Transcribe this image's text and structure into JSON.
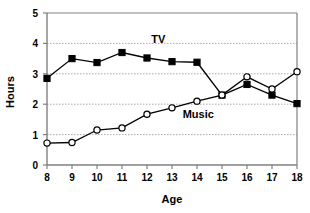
{
  "chart_data": {
    "type": "line",
    "title": "",
    "xlabel": "Age",
    "ylabel": "Hours",
    "categories": [
      8,
      9,
      10,
      11,
      12,
      13,
      14,
      15,
      16,
      17,
      18
    ],
    "x_tick_labels": [
      "8",
      "9",
      "10",
      "11",
      "12",
      "13",
      "14",
      "15",
      "16",
      "17",
      "18"
    ],
    "y_tick_labels": [
      "0",
      "1",
      "2",
      "3",
      "4",
      "5"
    ],
    "y_ticks": [
      0,
      1,
      2,
      3,
      4,
      5
    ],
    "ylim": [
      0,
      5
    ],
    "xlim": [
      8,
      18
    ],
    "grid": "horizontal-dotted",
    "legend_position": "inline-annotations",
    "series": [
      {
        "name": "TV",
        "marker": "filled-square",
        "color": "#000000",
        "values": [
          2.85,
          3.5,
          3.37,
          3.7,
          3.52,
          3.4,
          3.38,
          2.3,
          2.65,
          2.3,
          2.02
        ]
      },
      {
        "name": "Music",
        "marker": "open-circle",
        "color": "#000000",
        "values": [
          0.72,
          0.74,
          1.15,
          1.22,
          1.67,
          1.88,
          2.1,
          2.3,
          2.9,
          2.5,
          3.07
        ]
      }
    ],
    "annotations": [
      {
        "text": "TV",
        "x": 12.45,
        "y": 4.02
      },
      {
        "text": "Music",
        "x": 14.05,
        "y": 1.56
      }
    ]
  }
}
